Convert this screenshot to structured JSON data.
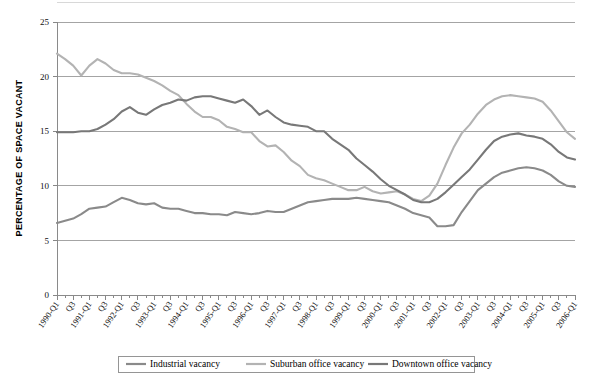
{
  "chart_data": {
    "type": "line",
    "title": "",
    "xlabel": "",
    "ylabel": "PERCENTAGE OF SPACE VACANT",
    "ylim": [
      0,
      25
    ],
    "yticks": [
      0,
      5,
      10,
      15,
      20,
      25
    ],
    "grid": true,
    "legend_position": "bottom",
    "x": [
      "1990-Q1",
      "1990-Q2",
      "1990-Q3",
      "1990-Q4",
      "1991-Q1",
      "1991-Q2",
      "1991-Q3",
      "1991-Q4",
      "1992-Q1",
      "1992-Q2",
      "1992-Q3",
      "1992-Q4",
      "1993-Q1",
      "1993-Q2",
      "1993-Q3",
      "1993-Q4",
      "1994-Q1",
      "1994-Q2",
      "1994-Q3",
      "1994-Q4",
      "1995-Q1",
      "1995-Q2",
      "1995-Q3",
      "1995-Q4",
      "1996-Q1",
      "1996-Q2",
      "1996-Q3",
      "1996-Q4",
      "1997-Q1",
      "1997-Q2",
      "1997-Q3",
      "1997-Q4",
      "1998-Q1",
      "1998-Q2",
      "1998-Q3",
      "1998-Q4",
      "1999-Q1",
      "1999-Q2",
      "1999-Q3",
      "1999-Q4",
      "2000-Q1",
      "2000-Q2",
      "2000-Q3",
      "2000-Q4",
      "2001-Q1",
      "2001-Q2",
      "2001-Q3",
      "2001-Q4",
      "2002-Q1",
      "2002-Q2",
      "2002-Q3",
      "2002-Q4",
      "2003-Q1",
      "2003-Q2",
      "2003-Q3",
      "2003-Q4",
      "2004-Q1",
      "2004-Q2",
      "2004-Q3",
      "2004-Q4",
      "2005-Q1",
      "2005-Q2",
      "2005-Q3",
      "2005-Q4",
      "2006-Q1"
    ],
    "xtick_labels": [
      "1990-Q1",
      "",
      "Q3",
      "",
      "1991-Q1",
      "",
      "Q3",
      "",
      "1992-Q1",
      "",
      "Q3",
      "",
      "1993-Q1",
      "",
      "Q3",
      "",
      "1994-Q1",
      "",
      "Q3",
      "",
      "1995-Q1",
      "",
      "Q3",
      "",
      "1996-Q1",
      "",
      "Q3",
      "",
      "1997-Q1",
      "",
      "Q3",
      "",
      "1998-Q1",
      "",
      "Q3",
      "",
      "1999-Q1",
      "",
      "Q3",
      "",
      "2000-Q1",
      "",
      "Q3",
      "",
      "2001-Q1",
      "",
      "Q3",
      "",
      "2002-Q1",
      "",
      "Q3",
      "",
      "2003-Q1",
      "",
      "Q3",
      "",
      "2004-Q1",
      "",
      "Q3",
      "",
      "2005-Q1",
      "",
      "Q3",
      "",
      "2006-Q1"
    ],
    "series": [
      {
        "name": "Industrial vacancy",
        "color": "#8a8a8a",
        "values": [
          6.6,
          6.8,
          7.0,
          7.4,
          7.9,
          8.0,
          8.1,
          8.5,
          8.9,
          8.7,
          8.4,
          8.3,
          8.4,
          8.0,
          7.9,
          7.9,
          7.7,
          7.5,
          7.5,
          7.4,
          7.4,
          7.3,
          7.6,
          7.5,
          7.4,
          7.5,
          7.7,
          7.6,
          7.6,
          7.9,
          8.2,
          8.5,
          8.6,
          8.7,
          8.8,
          8.8,
          8.8,
          8.9,
          8.8,
          8.7,
          8.6,
          8.5,
          8.2,
          7.9,
          7.5,
          7.3,
          7.1,
          6.3,
          6.3,
          6.4,
          7.6,
          8.6,
          9.6,
          10.2,
          10.8,
          11.2,
          11.4,
          11.6,
          11.7,
          11.6,
          11.4,
          11.0,
          10.4,
          10.0,
          9.9
        ]
      },
      {
        "name": "Suburban office vacancy",
        "color": "#b3b3b3",
        "values": [
          22.1,
          21.6,
          21.0,
          20.1,
          21.0,
          21.6,
          21.2,
          20.6,
          20.3,
          20.3,
          20.2,
          19.9,
          19.6,
          19.2,
          18.7,
          18.3,
          17.5,
          16.8,
          16.3,
          16.3,
          16.0,
          15.4,
          15.2,
          14.9,
          14.9,
          14.1,
          13.6,
          13.7,
          13.1,
          12.3,
          11.8,
          11.0,
          10.7,
          10.5,
          10.2,
          9.9,
          9.6,
          9.6,
          9.9,
          9.5,
          9.3,
          9.4,
          9.5,
          9.2,
          8.8,
          8.6,
          9.1,
          10.2,
          11.9,
          13.5,
          14.8,
          15.6,
          16.6,
          17.4,
          17.9,
          18.2,
          18.3,
          18.2,
          18.1,
          18.0,
          17.7,
          16.9,
          15.9,
          14.9,
          14.3
        ]
      },
      {
        "name": "Downtown office vacancy",
        "color": "#787878",
        "values": [
          14.9,
          14.9,
          14.9,
          15.0,
          15.0,
          15.2,
          15.6,
          16.1,
          16.8,
          17.2,
          16.7,
          16.5,
          17.0,
          17.4,
          17.6,
          17.9,
          17.8,
          18.1,
          18.2,
          18.2,
          18.0,
          17.8,
          17.6,
          17.9,
          17.3,
          16.5,
          16.9,
          16.3,
          15.8,
          15.6,
          15.5,
          15.4,
          15.0,
          15.0,
          14.3,
          13.8,
          13.3,
          12.5,
          11.9,
          11.3,
          10.6,
          10.0,
          9.6,
          9.2,
          8.7,
          8.5,
          8.5,
          8.8,
          9.4,
          10.1,
          10.8,
          11.5,
          12.4,
          13.3,
          14.1,
          14.5,
          14.7,
          14.8,
          14.6,
          14.5,
          14.3,
          13.8,
          13.1,
          12.6,
          12.4
        ]
      }
    ]
  },
  "legend": {
    "items": [
      {
        "label": "Industrial vacancy"
      },
      {
        "label": "Suburban office vacancy"
      },
      {
        "label": "Downtown office vacancy"
      }
    ]
  }
}
